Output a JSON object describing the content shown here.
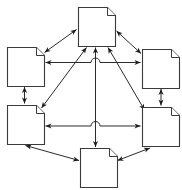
{
  "diagram": {
    "type": "node-link-graph",
    "canvas": {
      "width": 182,
      "height": 190
    },
    "background_color": "#ffffff",
    "node_shape": "document-page-with-folded-corner",
    "node_fill_color": "#ffffff",
    "node_stroke_color": "#3a3a3a",
    "edge_color": "#2b2b2b",
    "edge_style": "double-headed-arrow",
    "crossing_style": "line-hop-arc",
    "node_count": 6,
    "edge_count": 11,
    "nodes": [
      {
        "id": "top",
        "label": "",
        "x": 78,
        "y": 7,
        "w": 37,
        "h": 39
      },
      {
        "id": "upper-left",
        "label": "",
        "x": 7,
        "y": 47,
        "w": 37,
        "h": 39
      },
      {
        "id": "upper-right",
        "label": "",
        "x": 142,
        "y": 49,
        "w": 37,
        "h": 39
      },
      {
        "id": "lower-left",
        "label": "",
        "x": 7,
        "y": 105,
        "w": 37,
        "h": 39
      },
      {
        "id": "lower-right",
        "label": "",
        "x": 142,
        "y": 107,
        "w": 37,
        "h": 39
      },
      {
        "id": "bottom",
        "label": "",
        "x": 80,
        "y": 148,
        "w": 37,
        "h": 39
      }
    ],
    "edges": [
      {
        "from": "upper-left",
        "to": "top",
        "direction": "both"
      },
      {
        "from": "upper-right",
        "to": "top",
        "direction": "both"
      },
      {
        "from": "lower-left",
        "to": "top",
        "direction": "both"
      },
      {
        "from": "lower-right",
        "to": "top",
        "direction": "both"
      },
      {
        "from": "bottom",
        "to": "top",
        "direction": "both"
      },
      {
        "from": "upper-left",
        "to": "upper-right",
        "direction": "both"
      },
      {
        "from": "lower-left",
        "to": "lower-right",
        "direction": "both"
      },
      {
        "from": "upper-left",
        "to": "lower-left",
        "direction": "both"
      },
      {
        "from": "upper-right",
        "to": "lower-right",
        "direction": "both"
      },
      {
        "from": "lower-left",
        "to": "bottom",
        "direction": "both"
      },
      {
        "from": "bottom",
        "to": "lower-right",
        "direction": "both"
      }
    ]
  }
}
